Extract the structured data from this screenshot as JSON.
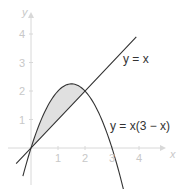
{
  "chart_data": {
    "type": "line",
    "title": "",
    "xlabel": "x",
    "ylabel": "y",
    "xlim": [
      -0.6,
      4.6
    ],
    "ylim": [
      -1.4,
      4.9
    ],
    "x_ticks": [
      1,
      2,
      3,
      4
    ],
    "y_ticks": [
      1,
      2,
      3,
      4
    ],
    "grid": false,
    "series": [
      {
        "name": "y = x",
        "label": "y = x",
        "expression": "x",
        "x_range": [
          -0.55,
          3.9
        ],
        "color": "#333333"
      },
      {
        "name": "y = x(3 − x)",
        "label": "y = x(3 − x)",
        "expression": "x*(3-x)",
        "x_range": [
          -0.3,
          3.45
        ],
        "color": "#333333"
      }
    ],
    "shaded_region": {
      "between": [
        "y = x(3 − x)",
        "y = x"
      ],
      "x_range": [
        0,
        2
      ],
      "color": "#dddddd"
    },
    "intersections": [
      [
        0,
        0
      ],
      [
        2,
        2
      ]
    ]
  },
  "colors": {
    "axis": "#d8d8d8",
    "curve": "#333333",
    "fill": "#e0e0e0"
  }
}
